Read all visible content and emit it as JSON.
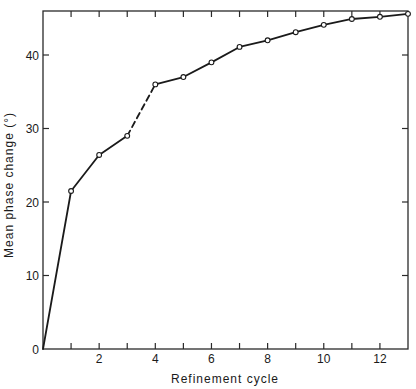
{
  "chart_data": {
    "type": "line",
    "title": "",
    "xlabel": "Refinement cycle",
    "ylabel": "Mean phase change (°)",
    "x": [
      0,
      1,
      2,
      3,
      4,
      5,
      6,
      7,
      8,
      9,
      10,
      11,
      12,
      13
    ],
    "series": [
      {
        "name": "Mean phase change",
        "values": [
          0,
          21.5,
          26.4,
          29.0,
          36.0,
          37.0,
          39.0,
          41.1,
          42.0,
          43.1,
          44.1,
          44.9,
          45.2,
          45.6
        ],
        "markers": [
          false,
          true,
          true,
          true,
          true,
          true,
          true,
          true,
          true,
          true,
          true,
          true,
          true,
          true
        ],
        "dashed_segments": [
          [
            3,
            4
          ]
        ]
      }
    ],
    "xlim": [
      0,
      13
    ],
    "ylim": [
      0,
      46
    ],
    "x_ticks": [
      1,
      2,
      3,
      4,
      5,
      6,
      7,
      8,
      9,
      10,
      11,
      12
    ],
    "x_tick_labels": [
      {
        "value": 2,
        "label": "2"
      },
      {
        "value": 4,
        "label": "4"
      },
      {
        "value": 6,
        "label": "6"
      },
      {
        "value": 8,
        "label": "8"
      },
      {
        "value": 10,
        "label": "10"
      },
      {
        "value": 12,
        "label": "12"
      }
    ],
    "y_ticks": [
      10,
      20,
      30,
      40
    ],
    "y_tick_labels": [
      {
        "value": 0,
        "label": "0"
      },
      {
        "value": 10,
        "label": "10"
      },
      {
        "value": 20,
        "label": "20"
      },
      {
        "value": 30,
        "label": "30"
      },
      {
        "value": 40,
        "label": "40"
      }
    ],
    "grid": false,
    "legend": null,
    "colors": {
      "line": "#1a1a1a",
      "axis": "#2a2a2a",
      "marker_fill": "#ffffff"
    }
  }
}
